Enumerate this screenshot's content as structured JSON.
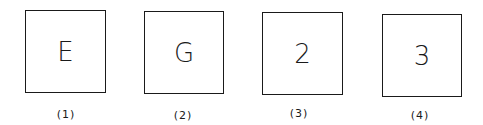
{
  "figure": {
    "panels": [
      {
        "symbol": "E",
        "caption": "(1)"
      },
      {
        "symbol": "G",
        "caption": "(2)"
      },
      {
        "symbol": "2",
        "caption": "(3)"
      },
      {
        "symbol": "3",
        "caption": "(4)"
      }
    ]
  }
}
